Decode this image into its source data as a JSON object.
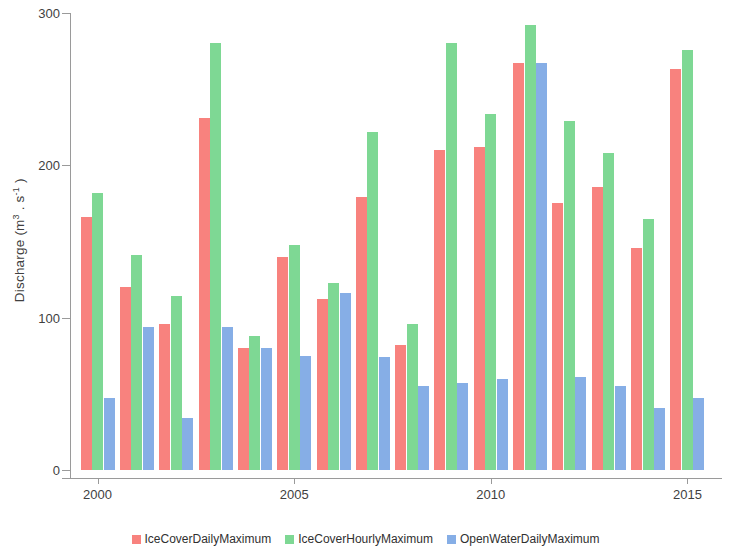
{
  "chart_data": {
    "type": "bar",
    "title": "",
    "xlabel": "",
    "ylabel": "Discharge (m3 . s-1)",
    "ylabel_html": "Discharge (m³·s⁻¹)",
    "ylim": [
      0,
      300
    ],
    "y_ticks": [
      0,
      100,
      200,
      300
    ],
    "y_tick_labels": [
      "0",
      "100",
      "200",
      "300"
    ],
    "xlim": [
      1999.3,
      2015.7
    ],
    "x_ticks": [
      2000,
      2005,
      2010,
      2015
    ],
    "x_tick_labels": [
      "2000",
      "2005",
      "2010",
      "2015"
    ],
    "grid": false,
    "legend_position": "bottom-center",
    "categories": [
      2000,
      2001,
      2002,
      2003,
      2004,
      2005,
      2006,
      2007,
      2008,
      2009,
      2010,
      2011,
      2012,
      2013,
      2014,
      2015
    ],
    "series": [
      {
        "name": "IceCoverDailyMaximum",
        "color": "#f8827e",
        "values": [
          166,
          120,
          96,
          231,
          80,
          140,
          112,
          179,
          82,
          210,
          212,
          267,
          175,
          186,
          146,
          263
        ]
      },
      {
        "name": "IceCoverHourlyMaximum",
        "color": "#7ed894",
        "values": [
          182,
          141,
          114,
          280,
          88,
          148,
          123,
          222,
          96,
          280,
          234,
          292,
          229,
          208,
          165,
          276
        ]
      },
      {
        "name": "OpenWaterDailyMaximum",
        "color": "#86aee6",
        "values": [
          47,
          94,
          34,
          94,
          80,
          75,
          116,
          74,
          55,
          57,
          60,
          267,
          61,
          55,
          41,
          47
        ]
      }
    ]
  },
  "legend": {
    "items": [
      {
        "label": "IceCoverDailyMaximum",
        "color": "#f8827e",
        "swatch_name": "legend-swatch-icecover-daily"
      },
      {
        "label": "IceCoverHourlyMaximum",
        "color": "#7ed894",
        "swatch_name": "legend-swatch-icecover-hourly"
      },
      {
        "label": "OpenWaterDailyMaximum",
        "color": "#86aee6",
        "swatch_name": "legend-swatch-openwater-daily"
      }
    ]
  },
  "axis": {
    "y_title_main": "Discharge (m",
    "y_title_sup1": "3",
    "y_title_mid": " . s",
    "y_title_sup2": "-1",
    "y_title_end": " )"
  }
}
